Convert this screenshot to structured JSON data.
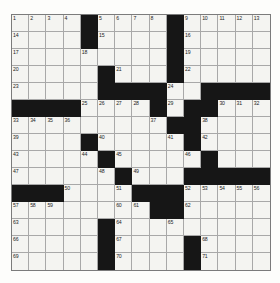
{
  "puzzle": {
    "title": "Crossword Grid",
    "size": {
      "rows": 15,
      "cols": 15
    },
    "colors": {
      "block": "#161616",
      "cell": "#f4f4f1",
      "grid_line": "#a8a8a8",
      "border": "#7b7b7b",
      "number_text": "#242424",
      "page_background": "#fdfdfb"
    },
    "legend": {
      "block_label": "black-square",
      "cell_label": "empty-square"
    },
    "blocks": [
      [
        0,
        4
      ],
      [
        0,
        9
      ],
      [
        1,
        4
      ],
      [
        1,
        9
      ],
      [
        2,
        9
      ],
      [
        3,
        5
      ],
      [
        3,
        9
      ],
      [
        4,
        5
      ],
      [
        4,
        6
      ],
      [
        4,
        7
      ],
      [
        4,
        8
      ],
      [
        4,
        11
      ],
      [
        4,
        12
      ],
      [
        4,
        13
      ],
      [
        4,
        14
      ],
      [
        5,
        0
      ],
      [
        5,
        1
      ],
      [
        5,
        2
      ],
      [
        5,
        3
      ],
      [
        5,
        8
      ],
      [
        5,
        10
      ],
      [
        5,
        11
      ],
      [
        6,
        9
      ],
      [
        6,
        10
      ],
      [
        7,
        4
      ],
      [
        7,
        10
      ],
      [
        8,
        5
      ],
      [
        8,
        11
      ],
      [
        9,
        6
      ],
      [
        9,
        10
      ],
      [
        9,
        11
      ],
      [
        9,
        12
      ],
      [
        9,
        13
      ],
      [
        9,
        14
      ],
      [
        10,
        0
      ],
      [
        10,
        1
      ],
      [
        10,
        2
      ],
      [
        10,
        7
      ],
      [
        10,
        8
      ],
      [
        10,
        9
      ],
      [
        11,
        8
      ],
      [
        11,
        9
      ],
      [
        12,
        5
      ],
      [
        13,
        5
      ],
      [
        13,
        10
      ],
      [
        14,
        5
      ],
      [
        14,
        10
      ]
    ],
    "numbers": [
      {
        "r": 0,
        "c": 0,
        "n": "1"
      },
      {
        "r": 0,
        "c": 1,
        "n": "2"
      },
      {
        "r": 0,
        "c": 2,
        "n": "3"
      },
      {
        "r": 0,
        "c": 3,
        "n": "4"
      },
      {
        "r": 0,
        "c": 5,
        "n": "5"
      },
      {
        "r": 0,
        "c": 6,
        "n": "6"
      },
      {
        "r": 0,
        "c": 7,
        "n": "7"
      },
      {
        "r": 0,
        "c": 8,
        "n": "8"
      },
      {
        "r": 0,
        "c": 10,
        "n": "9"
      },
      {
        "r": 0,
        "c": 11,
        "n": "10"
      },
      {
        "r": 0,
        "c": 12,
        "n": "11"
      },
      {
        "r": 0,
        "c": 13,
        "n": "12"
      },
      {
        "r": 0,
        "c": 14,
        "n": "13"
      },
      {
        "r": 1,
        "c": 0,
        "n": "14"
      },
      {
        "r": 1,
        "c": 5,
        "n": "15"
      },
      {
        "r": 1,
        "c": 10,
        "n": "16"
      },
      {
        "r": 2,
        "c": 0,
        "n": "17"
      },
      {
        "r": 2,
        "c": 4,
        "n": "18"
      },
      {
        "r": 2,
        "c": 10,
        "n": "19"
      },
      {
        "r": 3,
        "c": 0,
        "n": "20"
      },
      {
        "r": 3,
        "c": 6,
        "n": "21"
      },
      {
        "r": 3,
        "c": 10,
        "n": "22"
      },
      {
        "r": 4,
        "c": 0,
        "n": "23"
      },
      {
        "r": 4,
        "c": 9,
        "n": "24"
      },
      {
        "r": 5,
        "c": 4,
        "n": "25"
      },
      {
        "r": 5,
        "c": 5,
        "n": "26"
      },
      {
        "r": 5,
        "c": 6,
        "n": "27"
      },
      {
        "r": 5,
        "c": 7,
        "n": "28"
      },
      {
        "r": 5,
        "c": 9,
        "n": "29"
      },
      {
        "r": 5,
        "c": 12,
        "n": "30"
      },
      {
        "r": 5,
        "c": 13,
        "n": "31"
      },
      {
        "r": 5,
        "c": 14,
        "n": "32"
      },
      {
        "r": 6,
        "c": 0,
        "n": "33"
      },
      {
        "r": 6,
        "c": 1,
        "n": "34"
      },
      {
        "r": 6,
        "c": 2,
        "n": "35"
      },
      {
        "r": 6,
        "c": 3,
        "n": "36"
      },
      {
        "r": 6,
        "c": 8,
        "n": "37"
      },
      {
        "r": 6,
        "c": 11,
        "n": "38"
      },
      {
        "r": 7,
        "c": 0,
        "n": "39"
      },
      {
        "r": 7,
        "c": 5,
        "n": "40"
      },
      {
        "r": 7,
        "c": 9,
        "n": "41"
      },
      {
        "r": 7,
        "c": 11,
        "n": "42"
      },
      {
        "r": 8,
        "c": 0,
        "n": "43"
      },
      {
        "r": 8,
        "c": 4,
        "n": "44"
      },
      {
        "r": 8,
        "c": 6,
        "n": "45"
      },
      {
        "r": 8,
        "c": 10,
        "n": "46"
      },
      {
        "r": 9,
        "c": 0,
        "n": "47"
      },
      {
        "r": 9,
        "c": 5,
        "n": "48"
      },
      {
        "r": 9,
        "c": 7,
        "n": "49"
      },
      {
        "r": 10,
        "c": 3,
        "n": "50"
      },
      {
        "r": 10,
        "c": 6,
        "n": "51"
      },
      {
        "r": 10,
        "c": 10,
        "n": "52"
      },
      {
        "r": 10,
        "c": 11,
        "n": "53"
      },
      {
        "r": 10,
        "c": 12,
        "n": "54"
      },
      {
        "r": 10,
        "c": 13,
        "n": "55"
      },
      {
        "r": 10,
        "c": 14,
        "n": "56"
      },
      {
        "r": 11,
        "c": 0,
        "n": "57"
      },
      {
        "r": 11,
        "c": 1,
        "n": "58"
      },
      {
        "r": 11,
        "c": 2,
        "n": "59"
      },
      {
        "r": 11,
        "c": 6,
        "n": "60"
      },
      {
        "r": 11,
        "c": 7,
        "n": "61"
      },
      {
        "r": 11,
        "c": 10,
        "n": "62"
      },
      {
        "r": 12,
        "c": 0,
        "n": "63"
      },
      {
        "r": 12,
        "c": 6,
        "n": "64"
      },
      {
        "r": 12,
        "c": 9,
        "n": "65"
      },
      {
        "r": 13,
        "c": 0,
        "n": "66"
      },
      {
        "r": 13,
        "c": 6,
        "n": "67"
      },
      {
        "r": 13,
        "c": 11,
        "n": "68"
      },
      {
        "r": 14,
        "c": 0,
        "n": "69"
      },
      {
        "r": 14,
        "c": 6,
        "n": "70"
      },
      {
        "r": 14,
        "c": 11,
        "n": "71"
      }
    ]
  }
}
